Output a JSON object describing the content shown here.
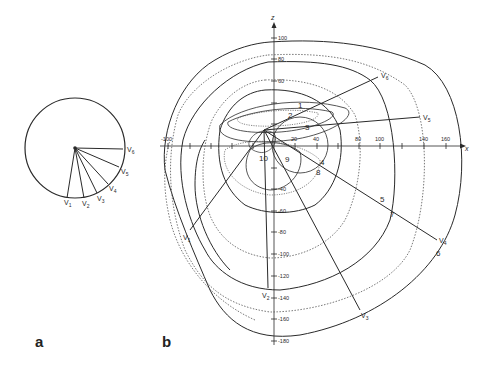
{
  "figure": {
    "panels": [
      {
        "id": "a",
        "label": "a"
      },
      {
        "id": "b",
        "label": "b"
      }
    ],
    "colors": {
      "ink": "#2a2a2a",
      "dotted": "#555555",
      "background": "#ffffff"
    }
  },
  "panel_a": {
    "description": "Circle with precordial lead vectors",
    "leads": [
      {
        "name": "V1",
        "sub": "1"
      },
      {
        "name": "V2",
        "sub": "2"
      },
      {
        "name": "V3",
        "sub": "3"
      },
      {
        "name": "V4",
        "sub": "4"
      },
      {
        "name": "V5",
        "sub": "5"
      },
      {
        "name": "V6",
        "sub": "6"
      }
    ]
  },
  "panel_b": {
    "axes": {
      "x_label": "x",
      "z_label": "z",
      "x_ticks": [
        "-100",
        "-80",
        "-60",
        "-40",
        "-20",
        "20",
        "40",
        "60",
        "80",
        "100",
        "120",
        "140",
        "160"
      ],
      "z_ticks_positive": [
        "20",
        "40",
        "60",
        "80",
        "100"
      ],
      "z_ticks_negative": [
        "-20",
        "-40",
        "-60",
        "-80",
        "-100",
        "-120",
        "-140",
        "-160",
        "-180"
      ]
    },
    "loop_labels": [
      "1",
      "2",
      "3",
      "4",
      "5",
      "6",
      "7",
      "8",
      "9",
      "10"
    ],
    "lead_labels": [
      {
        "name": "V1",
        "sub": "1"
      },
      {
        "name": "V2",
        "sub": "2"
      },
      {
        "name": "V3",
        "sub": "3"
      },
      {
        "name": "V4",
        "sub": "4"
      },
      {
        "name": "V5",
        "sub": "5"
      },
      {
        "name": "V6",
        "sub": "6"
      }
    ],
    "point_marker": "c"
  }
}
